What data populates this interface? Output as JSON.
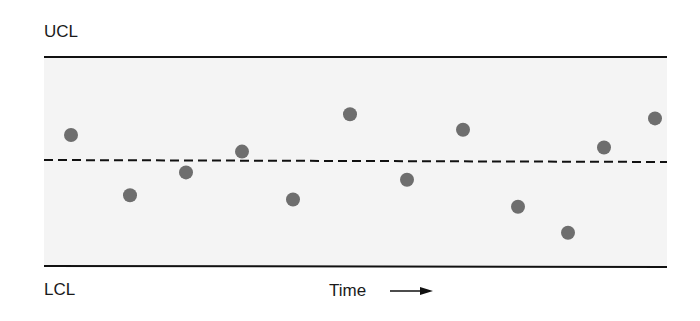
{
  "labels": {
    "ucl": "UCL",
    "lcl": "LCL",
    "xaxis": "Time"
  },
  "colors": {
    "band": "#f4f4f4",
    "line": "#111111",
    "point": "#6e6e6e"
  },
  "chart_data": {
    "type": "scatter",
    "title": "",
    "xlabel": "Time →",
    "ylabel": "",
    "annotations": [
      "UCL",
      "LCL"
    ],
    "reference_lines": [
      {
        "name": "UCL",
        "y": 1.0,
        "style": "solid"
      },
      {
        "name": "Center line",
        "y": 0.0,
        "style": "dashed"
      },
      {
        "name": "LCL",
        "y": -1.0,
        "style": "solid"
      }
    ],
    "ylim": [
      -1,
      1
    ],
    "grid": false,
    "legend": "none",
    "x": [
      1,
      2,
      3,
      4,
      5,
      6,
      7,
      8,
      9,
      10,
      11,
      12
    ],
    "values": [
      0.25,
      -0.33,
      -0.11,
      0.09,
      -0.37,
      0.45,
      -0.18,
      0.3,
      -0.44,
      -0.69,
      0.13,
      0.41
    ],
    "px": [
      71,
      130,
      186,
      242,
      293,
      350,
      407,
      463,
      518,
      568,
      604,
      655
    ]
  }
}
